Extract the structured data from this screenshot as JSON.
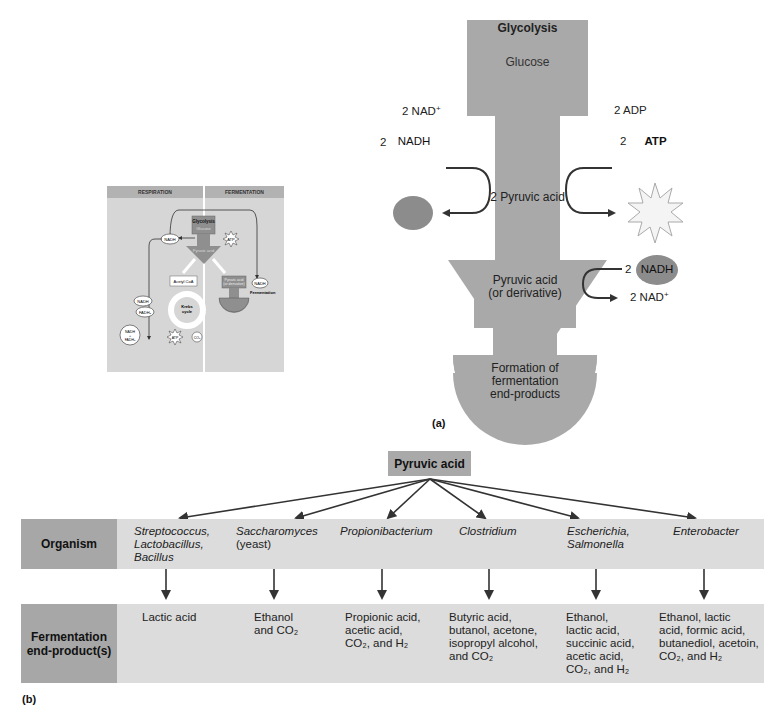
{
  "panel_a": {
    "label": "(a)",
    "glycolysis_title": "Glycolysis",
    "glucose": "Glucose",
    "pyruvic_output": "2 Pyruvic acid",
    "nad_in": "2 NAD⁺",
    "nadh_coef": "2",
    "nadh": "NADH",
    "adp_in": "2 ADP",
    "atp_coef": "2",
    "atp": "ATP",
    "fermentation_box": "Pyruvic acid (or derivative)",
    "fermentation_box_line1": "Pyruvic acid",
    "fermentation_box_line2": "(or derivative)",
    "nadh_in_coef": "2",
    "nadh_in": "NADH",
    "nad_out": "2 NAD⁺",
    "endproducts_line1": "Formation of",
    "endproducts_line2": "fermentation",
    "endproducts_line3": "end-products",
    "colors": {
      "process_gray": "#a9a9a9",
      "nadh_oval": "#8c8c8c",
      "arrow": "#333333",
      "atp_star": "#f4f4f4"
    }
  },
  "thumbnail": {
    "headers": [
      "RESPIRATION",
      "FERMENTATION"
    ],
    "glycolysis": "Glycolysis",
    "glucose": "Glucose",
    "pyruvic": "Pyruvic acid",
    "nadh": "NADH",
    "atp": "ATP",
    "acetyl_coa": "Acetyl CoA",
    "krebs": "Krebs cycle",
    "nadh2": "NADH",
    "fadh2": "FADH₂",
    "nadh_fadh": "NADH + FADH₂",
    "co2": "CO₂",
    "electrons": "Electrons",
    "etc": "Electron transport chain and chemiosmosis",
    "o2": "O₂",
    "h2o": "H₂O",
    "pyruvic_derivative": "Pyruvic acid (or derivative)",
    "fermentation": "Fermentation",
    "formation": "Formation of fermentation end-products",
    "colors": {
      "background": "#d6d6d6",
      "header": "#b2b2b2",
      "process": "#8f8f8f"
    }
  },
  "panel_b": {
    "label": "(b)",
    "source": "Pyruvic acid",
    "organism_header": "Organism",
    "endproduct_header_line1": "Fermentation",
    "endproduct_header_line2": "end-product(s)",
    "organisms": [
      {
        "lines": [
          "Streptococcus,",
          "Lactobacillus,",
          "Bacillus"
        ],
        "products": [
          "Lactic acid"
        ]
      },
      {
        "lines": [
          "Saccharomyces",
          "(yeast)"
        ],
        "products": [
          "Ethanol",
          "and CO₂"
        ]
      },
      {
        "lines": [
          "Propionibacterium"
        ],
        "products": [
          "Propionic acid,",
          "acetic acid,",
          "CO₂, and H₂"
        ]
      },
      {
        "lines": [
          "Clostridium"
        ],
        "products": [
          "Butyric acid,",
          "butanol, acetone,",
          "isopropyl alcohol,",
          "and CO₂"
        ]
      },
      {
        "lines": [
          "Escherichia,",
          "Salmonella"
        ],
        "products": [
          "Ethanol,",
          "lactic acid,",
          "succinic acid,",
          "acetic acid,",
          "CO₂, and H₂"
        ]
      },
      {
        "lines": [
          "Enterobacter"
        ],
        "products": [
          "Ethanol, lactic",
          "acid, formic acid,",
          "butanediol, acetoin,",
          "CO₂, and H₂"
        ]
      }
    ],
    "colors": {
      "header_cell": "#a7a7a7",
      "band": "#dcdcdc",
      "source_box": "#a9a9a9"
    }
  }
}
